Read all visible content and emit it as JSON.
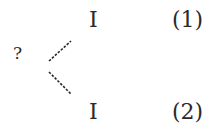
{
  "diagram": {
    "root": {
      "label": "?"
    },
    "branches": [
      {
        "node": "I",
        "number": "(1)"
      },
      {
        "node": "I",
        "number": "(2)"
      }
    ],
    "edge_style": "dashed",
    "color": "#2a2a2a"
  }
}
